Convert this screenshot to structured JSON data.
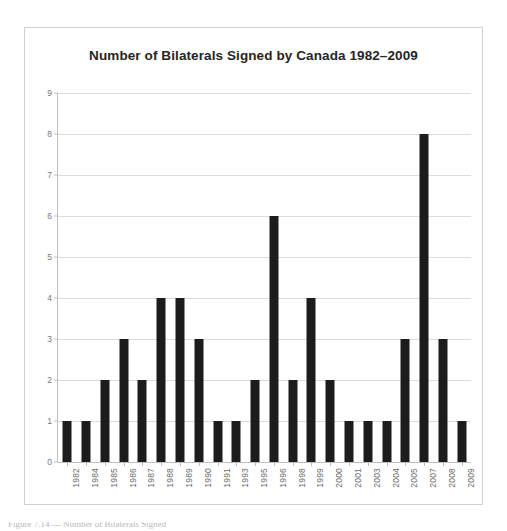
{
  "chart_data": {
    "type": "bar",
    "title": "Number of Bilaterals Signed by Canada 1982–2009",
    "xlabel": "",
    "ylabel": "",
    "ylim": [
      0,
      9
    ],
    "yticks": [
      0,
      1,
      2,
      3,
      4,
      5,
      6,
      7,
      8,
      9
    ],
    "grid": true,
    "legend": false,
    "bar_color": "#1c1c1c",
    "categories": [
      "1982",
      "1984",
      "1985",
      "1986",
      "1987",
      "1988",
      "1989",
      "1990",
      "1991",
      "1993",
      "1995",
      "1996",
      "1998",
      "1999",
      "2000",
      "2001",
      "2003",
      "2004",
      "2005",
      "2007",
      "2008",
      "2009"
    ],
    "values": [
      1,
      1,
      2,
      3,
      2,
      4,
      4,
      3,
      1,
      1,
      2,
      6,
      2,
      4,
      2,
      1,
      1,
      1,
      3,
      8,
      3,
      1
    ]
  },
  "figure": {
    "caption_clipped": "Figure 7.14 — Number of Bilaterals Signed"
  }
}
